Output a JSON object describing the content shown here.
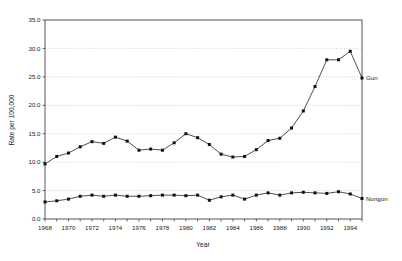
{
  "chart_data": {
    "type": "line",
    "title": "",
    "xlabel": "Year",
    "ylabel": "Rate per 100,000",
    "xlim": [
      1968,
      1995
    ],
    "ylim": [
      0.0,
      35.0
    ],
    "yticks": [
      "0.0",
      "5.0",
      "10.0",
      "15.0",
      "20.0",
      "25.0",
      "30.0",
      "35.0"
    ],
    "ytick_values": [
      0.0,
      5.0,
      10.0,
      15.0,
      20.0,
      25.0,
      30.0,
      35.0
    ],
    "xticks": [
      "1968",
      "1970",
      "1972",
      "1974",
      "1976",
      "1978",
      "1980",
      "1982",
      "1984",
      "1986",
      "1988",
      "1990",
      "1992",
      "1994"
    ],
    "xtick_values": [
      1968,
      1970,
      1972,
      1974,
      1976,
      1978,
      1980,
      1982,
      1984,
      1986,
      1988,
      1990,
      1992,
      1994
    ],
    "x": [
      1968,
      1969,
      1970,
      1971,
      1972,
      1973,
      1974,
      1975,
      1976,
      1977,
      1978,
      1979,
      1980,
      1981,
      1982,
      1983,
      1984,
      1985,
      1986,
      1987,
      1988,
      1989,
      1990,
      1991,
      1992,
      1993,
      1994,
      1995
    ],
    "grid": true,
    "legend_position": "right-inline",
    "series": [
      {
        "name": "Gun",
        "label": "Gun",
        "color": "#111111",
        "marker": "square",
        "values": [
          9.7,
          11.0,
          11.6,
          12.7,
          13.6,
          13.3,
          14.4,
          13.7,
          12.1,
          12.3,
          12.1,
          13.4,
          15.0,
          14.3,
          13.1,
          11.4,
          10.9,
          11.0,
          12.2,
          13.8,
          14.2,
          16.0,
          19.0,
          23.3,
          28.0,
          28.0,
          29.5,
          24.8
        ]
      },
      {
        "name": "Nongun",
        "label": "Nongun",
        "color": "#111111",
        "marker": "square",
        "values": [
          3.0,
          3.2,
          3.5,
          4.0,
          4.2,
          4.0,
          4.2,
          4.0,
          4.0,
          4.1,
          4.2,
          4.2,
          4.1,
          4.2,
          3.3,
          3.9,
          4.2,
          3.5,
          4.2,
          4.6,
          4.2,
          4.6,
          4.7,
          4.6,
          4.5,
          4.8,
          4.4,
          3.6
        ]
      }
    ]
  },
  "layout": {
    "plot_left": 45,
    "plot_right": 362,
    "plot_top": 20,
    "plot_bottom": 219
  }
}
